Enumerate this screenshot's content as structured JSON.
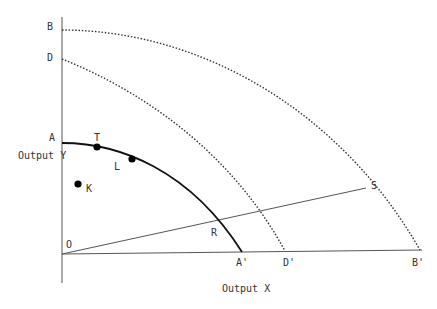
{
  "diagram": {
    "type": "production-possibility-frontiers",
    "axes": {
      "x_label": "Output X",
      "y_label": "Output Y",
      "origin_label": "O"
    },
    "curves": [
      {
        "name": "frontier-AA",
        "start_label": "A",
        "end_label": "A'",
        "style": "solid"
      },
      {
        "name": "frontier-DD",
        "start_label": "D",
        "end_label": "D'",
        "style": "dotted"
      },
      {
        "name": "frontier-BB",
        "start_label": "B",
        "end_label": "B'",
        "style": "dotted"
      }
    ],
    "points": [
      {
        "label": "T",
        "on": "frontier-AA"
      },
      {
        "label": "L",
        "on": "frontier-AA"
      },
      {
        "label": "K",
        "on": "interior"
      },
      {
        "label": "R",
        "on": "ray-OS ∩ frontier-AA"
      },
      {
        "label": "S",
        "on": "ray-OS ∩ frontier-BB"
      }
    ],
    "ray": {
      "from": "O",
      "to": "S"
    }
  },
  "labels": {
    "A": "A",
    "A_prime": "A'",
    "B": "B",
    "B_prime": "B'",
    "D": "D",
    "D_prime": "D'",
    "T": "T",
    "L": "L",
    "K": "K",
    "R": "R",
    "S": "S",
    "O": "O",
    "x_axis": "Output X",
    "y_axis": "Output Y"
  }
}
